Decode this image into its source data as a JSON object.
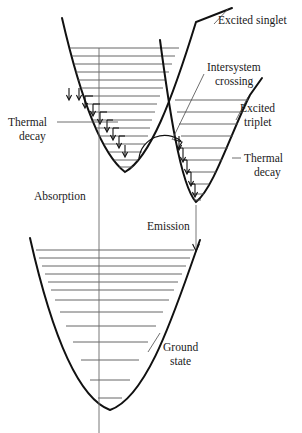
{
  "figure": {
    "kind": "potential-energy-curve-diagram",
    "title_cropped": "",
    "background": "#ffffff",
    "ink_color": "#111111",
    "level_color": "#555555"
  },
  "labels": {
    "excited_singlet": "Excited singlet",
    "intersystem_crossing_line1": "Intersystem",
    "intersystem_crossing_line2": "crossing",
    "excited_triplet_line1": "Excited",
    "excited_triplet_line2": "triplet",
    "thermal_decay_left_line1": "Thermal",
    "thermal_decay_left_line2": "decay",
    "thermal_decay_right_line1": "Thermal",
    "thermal_decay_right_line2": "decay",
    "absorption": "Absorption",
    "emission": "Emission",
    "ground_state_line1": "Ground",
    "ground_state_line2": "state"
  },
  "label_positions": {
    "excited_singlet": {
      "x": 218,
      "y": 22
    },
    "intersystem_crossing": {
      "x": 207,
      "y": 68
    },
    "excited_triplet": {
      "x": 240,
      "y": 110
    },
    "thermal_decay_left": {
      "x": 8,
      "y": 122
    },
    "thermal_decay_right": {
      "x": 239,
      "y": 158
    },
    "absorption": {
      "x": 34,
      "y": 198
    },
    "emission": {
      "x": 147,
      "y": 228
    },
    "ground_state": {
      "x": 152,
      "y": 348
    }
  },
  "wells": {
    "excited_singlet": {
      "name": "Excited singlet",
      "minimum": {
        "x": 125,
        "y": 172
      },
      "left_top": {
        "x": 62,
        "y": 18
      },
      "right_top": {
        "x": 163,
        "y": 36
      },
      "levels_y": [
        48,
        56,
        64,
        72,
        80,
        88,
        96,
        104,
        112,
        120,
        128,
        136,
        144,
        152,
        160,
        167
      ]
    },
    "excited_triplet": {
      "name": "Excited triplet",
      "minimum": {
        "x": 196,
        "y": 202
      },
      "left_top": {
        "x": 160,
        "y": 40
      },
      "right_top": {
        "x": 250,
        "y": 95
      },
      "levels_y": [
        100,
        112,
        124,
        136,
        148,
        160,
        172,
        184,
        194,
        200
      ]
    },
    "ground_state": {
      "name": "Ground state",
      "minimum": {
        "x": 110,
        "y": 410
      },
      "left_top": {
        "x": 30,
        "y": 238
      },
      "right_top": {
        "x": 200,
        "y": 240
      },
      "levels_y": [
        250,
        258,
        266,
        274,
        282,
        290,
        300,
        312,
        326,
        342,
        360,
        380,
        398
      ]
    }
  },
  "transitions": {
    "absorption": {
      "x": 99,
      "y_from": 48,
      "y_to": 433,
      "direction": "up",
      "label": "Absorption"
    },
    "emission": {
      "x": 196,
      "y_from": 205,
      "y_to": 250,
      "direction": "down",
      "label": "Emission"
    },
    "intersystem_crossing": {
      "label": "Intersystem crossing",
      "arc_from": {
        "x": 143,
        "y": 150
      },
      "arc_to": {
        "x": 180,
        "y": 145
      },
      "leader_from": {
        "x": 205,
        "y": 72
      },
      "leader_to": {
        "x": 172,
        "y": 140
      }
    },
    "thermal_decay_singlet": {
      "label": "Thermal decay",
      "arrow_count": 9,
      "start": {
        "x": 70,
        "y": 95
      },
      "end": {
        "x": 122,
        "y": 168
      }
    },
    "thermal_decay_triplet": {
      "label": "Thermal decay",
      "arrow_count": 5,
      "start": {
        "x": 178,
        "y": 140
      },
      "end": {
        "x": 196,
        "y": 200
      }
    }
  },
  "leader_lines": {
    "thermal_decay_left": {
      "x1": 57,
      "y1": 122,
      "x2": 118,
      "y2": 122
    },
    "thermal_decay_right": {
      "x1": 233,
      "y1": 158,
      "x2": 242,
      "y2": 158
    }
  },
  "axes": {
    "y_axis_label": "Energy",
    "x_axis_label": "Nuclear configuration",
    "visible": false
  }
}
